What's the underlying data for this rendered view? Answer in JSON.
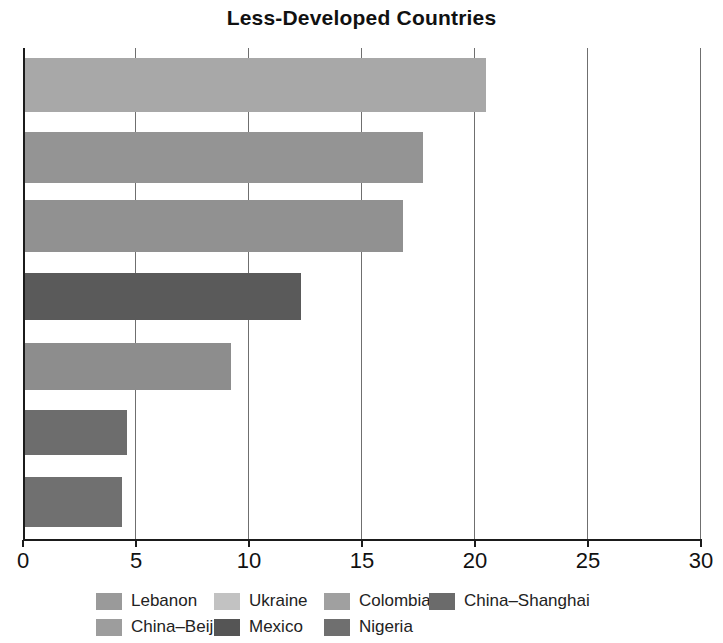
{
  "chart_data": {
    "type": "bar",
    "orientation": "horizontal",
    "title": "Less-Developed Countries",
    "xlabel": "",
    "ylabel": "",
    "xlim": [
      0,
      30
    ],
    "xticks": [
      0,
      5,
      10,
      15,
      20,
      25,
      30
    ],
    "xtick_labels": [
      "0",
      "5",
      "10",
      "15",
      "20",
      "25",
      "30"
    ],
    "grid": true,
    "grid_axis": "x",
    "legend_position": "bottom",
    "categories": [
      "Lebanon",
      "Ukraine",
      "Colombia",
      "China–Shanghai",
      "China–Beijing",
      "Mexico",
      "Nigeria"
    ],
    "values": [
      20.5,
      17.7,
      16.8,
      12.3,
      9.2,
      4.6,
      4.4
    ],
    "colors": [
      "#a8a8a8",
      "#949494",
      "#919191",
      "#5a5a5a",
      "#8d8d8d",
      "#6d6d6d",
      "#707070"
    ],
    "bars": [
      {
        "label": "Lebanon",
        "value": 20.5,
        "color": "#a8a8a8",
        "top": 10,
        "height": 54
      },
      {
        "label": "Ukraine",
        "value": 17.7,
        "color": "#949494",
        "top": 84,
        "height": 51
      },
      {
        "label": "Colombia",
        "value": 16.8,
        "color": "#919191",
        "top": 152,
        "height": 52
      },
      {
        "label": "China–Shanghai",
        "value": 12.3,
        "color": "#5a5a5a",
        "top": 225,
        "height": 47
      },
      {
        "label": "China–Beijing",
        "value": 9.2,
        "color": "#8d8d8d",
        "top": 295,
        "height": 47
      },
      {
        "label": "Mexico",
        "value": 4.6,
        "color": "#6d6d6d",
        "top": 362,
        "height": 45
      },
      {
        "label": "Nigeria",
        "value": 4.4,
        "color": "#707070",
        "top": 429,
        "height": 50
      }
    ]
  },
  "legend": {
    "rows": [
      [
        {
          "label": "Lebanon",
          "color": "#9a9a9a",
          "gap": 0,
          "label_width": 118
        },
        {
          "label": "Ukraine",
          "color": "#c2c2c2",
          "gap": 0,
          "label_width": 110
        },
        {
          "label": "Colombia",
          "color": "#a0a0a0",
          "gap": 0,
          "label_width": 105
        },
        {
          "label": "China–Shanghai",
          "color": "#6b6b6b",
          "gap": 0,
          "label_width": 150
        }
      ],
      [
        {
          "label": "China–Beijing",
          "color": "#9d9d9d",
          "gap": 0,
          "label_width": 118
        },
        {
          "label": "Mexico",
          "color": "#555555",
          "gap": 0,
          "label_width": 110
        },
        {
          "label": "Nigeria",
          "color": "#6f6f6f",
          "gap": 0,
          "label_width": 105
        }
      ]
    ]
  },
  "style": {
    "background": "#ffffff",
    "axis_color": "#1b1b1b",
    "grid_color": "#6f6f6f",
    "text_color": "#111111"
  }
}
